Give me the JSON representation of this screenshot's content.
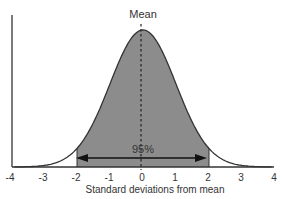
{
  "chart_data": {
    "type": "area",
    "title": "",
    "annotation_top": "Mean",
    "annotation_center": "95%",
    "xlabel": "Standard deviations from mean",
    "ylabel": "",
    "xlim": [
      -4,
      4
    ],
    "x_ticks": [
      "-4",
      "-3",
      "-2",
      "-1",
      "0",
      "1",
      "2",
      "3",
      "4"
    ],
    "distribution": "normal",
    "mean": 0,
    "sd": 1,
    "shaded_range": [
      -2,
      2
    ],
    "shaded_fraction": 0.95,
    "colors": {
      "shade": "#8c8c8c",
      "line": "#333333",
      "axis": "#333333"
    },
    "grid": false,
    "legend": null
  }
}
